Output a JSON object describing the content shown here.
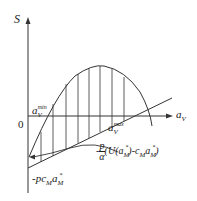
{
  "diagram": {
    "y_axis_label": "S",
    "x_axis_label": "a",
    "x_axis_label_sub": "V",
    "origin_label": "0",
    "a_min_label": "a",
    "a_min_sub": "V",
    "a_min_sup": "min",
    "a_max_label": "a",
    "a_max_sub": "V",
    "a_max_sup": "max",
    "intercept_label": "-pc",
    "intercept_sub": "M",
    "intercept_a": "a",
    "intercept_a_sub": "M",
    "intercept_a_sup": "*",
    "annotation_prefix": "-",
    "annotation_num": "p",
    "annotation_den": "α",
    "annotation_body": "(U(a",
    "annotation_sub1": "M",
    "annotation_sup1": "*",
    "annotation_mid": ")-c",
    "annotation_sub2": "M",
    "annotation_a": "a",
    "annotation_sub3": "M",
    "annotation_sup3": "*",
    "annotation_end": ")",
    "colors": {
      "line": "#333333",
      "background": "#ffffff"
    }
  }
}
